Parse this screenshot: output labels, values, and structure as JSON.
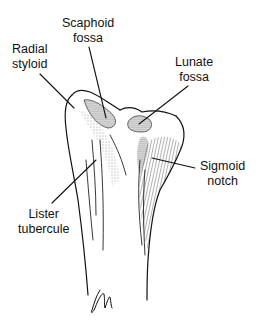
{
  "figure": {
    "signature": "gm",
    "colors": {
      "background": "#ffffff",
      "ink": "#111111"
    }
  },
  "labels": [
    {
      "id": "scaphoid-fossa",
      "line1": "Scaphoid",
      "line2": "fossa"
    },
    {
      "id": "radial-styloid",
      "line1": "Radial",
      "line2": "styloid"
    },
    {
      "id": "lunate-fossa",
      "line1": "Lunate",
      "line2": "fossa"
    },
    {
      "id": "sigmoid-notch",
      "line1": "Sigmoid",
      "line2": "notch"
    },
    {
      "id": "lister-tubercule",
      "line1": "Lister",
      "line2": "tubercule"
    }
  ]
}
